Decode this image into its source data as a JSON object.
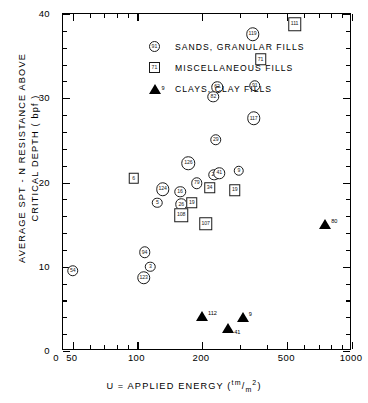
{
  "chart_data": {
    "type": "scatter",
    "title": "",
    "xlabel": "U = APPLIED  ENERGY (tm/m²)",
    "xlabel_parts": {
      "prefix": "U = APPLIED  ENERGY (",
      "sup": "tm",
      "slash": "/",
      "sub": "m",
      "sub_exp": "2",
      "suffix": ")"
    },
    "ylabel_line1": "AVERAGE SPT - N RESISTANCE ABOVE",
    "ylabel_line2": "CRITICAL DEPTH ( bpf )",
    "xscale": "log",
    "xlim": [
      45,
      1000
    ],
    "xticks": [
      50,
      100,
      200,
      500,
      1000
    ],
    "xtick_labels": [
      "50",
      "100",
      "200",
      "500",
      "1000"
    ],
    "x_origin_label": "0",
    "ylim": [
      0,
      40
    ],
    "yticks": [
      0,
      10,
      20,
      30,
      40
    ],
    "ytick_labels": [
      "0",
      "10",
      "20",
      "30",
      "40"
    ],
    "grid": false,
    "legend_position": "upper-left-inside",
    "legend": [
      {
        "marker": "circle",
        "key_label": "91",
        "label": "SANDS, GRANULAR FILLS"
      },
      {
        "marker": "square",
        "key_label": "71",
        "label": "MISCELLANEOUS FILLS"
      },
      {
        "marker": "triangle",
        "key_label": "9",
        "label": "CLAYS, CLAY FILLS"
      }
    ],
    "series": [
      {
        "name": "SANDS, GRANULAR FILLS",
        "marker": "circle",
        "points": [
          {
            "label": "54",
            "x": 50,
            "y": 9.5
          },
          {
            "label": "94",
            "x": 108,
            "y": 11.7
          },
          {
            "label": "3",
            "x": 115,
            "y": 10.0
          },
          {
            "label": "123",
            "x": 107,
            "y": 8.7
          },
          {
            "label": "124",
            "x": 131,
            "y": 19.2
          },
          {
            "label": "5",
            "x": 124,
            "y": 17.6
          },
          {
            "label": "16",
            "x": 158,
            "y": 18.9
          },
          {
            "label": "26",
            "x": 160,
            "y": 17.4
          },
          {
            "label": "126",
            "x": 173,
            "y": 22.3
          },
          {
            "label": "79",
            "x": 189,
            "y": 19.9
          },
          {
            "label": "22",
            "x": 228,
            "y": 20.9
          },
          {
            "label": "41",
            "x": 241,
            "y": 21.1
          },
          {
            "label": "9",
            "x": 297,
            "y": 21.4
          },
          {
            "label": "29",
            "x": 232,
            "y": 25.1
          },
          {
            "label": "62",
            "x": 235,
            "y": 31.3
          },
          {
            "label": "82",
            "x": 226,
            "y": 30.2
          },
          {
            "label": "91",
            "x": 352,
            "y": 31.5
          },
          {
            "label": "117",
            "x": 348,
            "y": 27.6
          },
          {
            "label": "119",
            "x": 344,
            "y": 37.6
          }
        ]
      },
      {
        "name": "MISCELLANEOUS FILLS",
        "marker": "square",
        "points": [
          {
            "label": "6",
            "x": 96,
            "y": 20.5
          },
          {
            "label": "19",
            "x": 179,
            "y": 17.6
          },
          {
            "label": "108",
            "x": 160,
            "y": 16.1
          },
          {
            "label": "34",
            "x": 217,
            "y": 19.4
          },
          {
            "label": "19",
            "x": 284,
            "y": 19.1
          },
          {
            "label": "107",
            "x": 208,
            "y": 15.1
          },
          {
            "label": "71",
            "x": 375,
            "y": 34.6
          },
          {
            "label": "111",
            "x": 540,
            "y": 38.8
          }
        ]
      },
      {
        "name": "CLAYS, CLAY FILLS",
        "marker": "triangle",
        "points": [
          {
            "label": "112",
            "x": 200,
            "y": 4.1
          },
          {
            "label": "41",
            "x": 265,
            "y": 2.7
          },
          {
            "label": "9",
            "x": 310,
            "y": 4.0
          },
          {
            "label": "80",
            "x": 750,
            "y": 15.1
          }
        ]
      }
    ]
  }
}
